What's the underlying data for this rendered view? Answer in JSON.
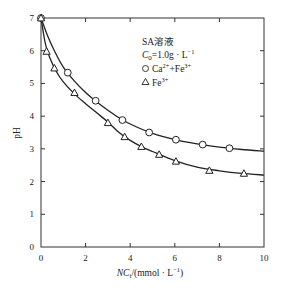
{
  "chart_data": {
    "type": "line",
    "title": "",
    "xlabel": "NCi/(mmol · L⁻¹)",
    "xlabel_parts": {
      "italic": "NC",
      "sub": "i",
      "rest": "/(mmol · L",
      "sup": "−1",
      "close": ")"
    },
    "ylabel": "pH",
    "xlim": [
      0,
      10
    ],
    "ylim": [
      0,
      7
    ],
    "xticks": [
      0,
      2,
      4,
      6,
      8,
      10
    ],
    "yticks": [
      0,
      1,
      2,
      3,
      4,
      5,
      6,
      7
    ],
    "grid": false,
    "legend": {
      "placement": "top-right",
      "title_line1": "SA溶液",
      "title_line2": {
        "c": "C",
        "sub": "0",
        "rest": "=1.0g · L",
        "sup": "−1"
      },
      "entries": [
        {
          "marker": "circle",
          "label_base": "Ca",
          "label_sup1": "2+",
          "label_mid": "+Fe",
          "label_sup2": "3+"
        },
        {
          "marker": "triangle",
          "label_base": "Fe",
          "label_sup1": "3+"
        }
      ]
    },
    "series": [
      {
        "name": "Ca²⁺+Fe³⁺",
        "marker": "circle",
        "points": [
          [
            0,
            7.0
          ],
          [
            1.2,
            5.33
          ],
          [
            2.45,
            4.47
          ],
          [
            3.65,
            3.88
          ],
          [
            4.85,
            3.5
          ],
          [
            6.05,
            3.28
          ],
          [
            7.25,
            3.13
          ],
          [
            8.45,
            3.02
          ]
        ],
        "fit_curve": [
          [
            0,
            7.0
          ],
          [
            0.3,
            6.45
          ],
          [
            0.6,
            6.0
          ],
          [
            1.0,
            5.5
          ],
          [
            1.5,
            5.07
          ],
          [
            2.0,
            4.72
          ],
          [
            2.5,
            4.43
          ],
          [
            3.0,
            4.18
          ],
          [
            3.5,
            3.95
          ],
          [
            4.0,
            3.76
          ],
          [
            5.0,
            3.47
          ],
          [
            6.0,
            3.28
          ],
          [
            7.0,
            3.15
          ],
          [
            8.0,
            3.05
          ],
          [
            9.0,
            2.98
          ],
          [
            10.0,
            2.93
          ]
        ]
      },
      {
        "name": "Fe³⁺",
        "marker": "triangle",
        "points": [
          [
            0,
            7.0
          ],
          [
            0.25,
            5.98
          ],
          [
            0.6,
            5.47
          ],
          [
            1.5,
            4.72
          ],
          [
            3.0,
            3.8
          ],
          [
            3.75,
            3.37
          ],
          [
            4.5,
            3.07
          ],
          [
            5.3,
            2.83
          ],
          [
            6.05,
            2.62
          ],
          [
            7.55,
            2.34
          ],
          [
            9.1,
            2.25
          ]
        ],
        "fit_curve": [
          [
            0,
            7.0
          ],
          [
            0.2,
            6.2
          ],
          [
            0.4,
            5.78
          ],
          [
            0.7,
            5.35
          ],
          [
            1.0,
            5.05
          ],
          [
            1.5,
            4.68
          ],
          [
            2.0,
            4.38
          ],
          [
            2.5,
            4.1
          ],
          [
            3.0,
            3.82
          ],
          [
            3.5,
            3.5
          ],
          [
            4.0,
            3.26
          ],
          [
            4.5,
            3.07
          ],
          [
            5.0,
            2.92
          ],
          [
            6.0,
            2.64
          ],
          [
            7.0,
            2.44
          ],
          [
            8.0,
            2.33
          ],
          [
            9.0,
            2.25
          ],
          [
            10.0,
            2.2
          ]
        ]
      }
    ]
  }
}
